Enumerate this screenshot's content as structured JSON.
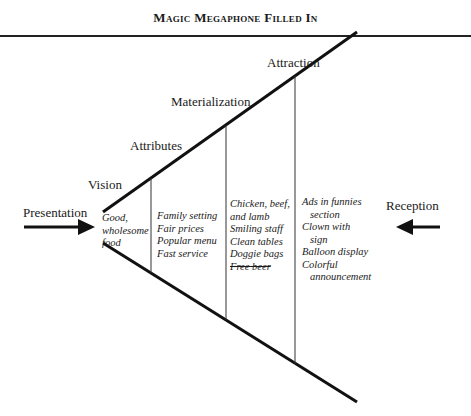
{
  "title": "Magic Megaphone Filled In",
  "stages": {
    "vision": "Vision",
    "attributes": "Attributes",
    "materialization": "Materialization",
    "attraction": "Attraction"
  },
  "sides": {
    "left": "Presentation",
    "right": "Reception"
  },
  "columns": {
    "vision": [
      "Good,",
      "wholesome",
      "food"
    ],
    "attributes": [
      "Family setting",
      "Fair prices",
      "Popular menu",
      "Fast service"
    ],
    "materialization": [
      "Chicken, beef,",
      "and lamb",
      "Smiling staff",
      "Clean tables",
      "Doggie bags",
      "Free beer"
    ],
    "attraction": [
      "Ads in funnies",
      "section",
      "Clown with",
      "sign",
      "Balloon display",
      "Colorful",
      "announcement"
    ]
  },
  "struck_items": [
    "Free beer"
  ]
}
